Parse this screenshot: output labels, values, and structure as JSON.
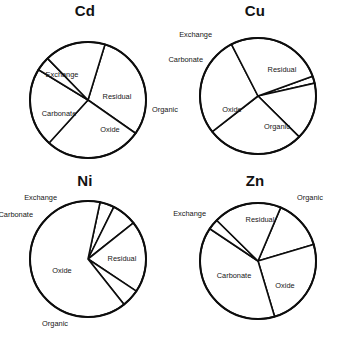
{
  "figure": {
    "background_color": "#ffffff",
    "stroke_color": "#0d0d0d",
    "slice_fill": "#ffffff"
  },
  "chart_data": [
    {
      "type": "pie",
      "title": "Cd",
      "categories": [
        "Exchange",
        "Carbonate",
        "Oxide",
        "Organic",
        "Residual"
      ],
      "values": [
        30,
        27,
        22,
        4,
        17
      ],
      "legend": "none",
      "labels_placement": [
        "inside",
        "inside",
        "inside",
        "outside-right",
        "inside"
      ],
      "start_angle_deg": 287,
      "direction": "clockwise"
    },
    {
      "type": "pie",
      "title": "Cu",
      "categories": [
        "Exchange",
        "Carbonate",
        "Oxide",
        "Organic",
        "Residual"
      ],
      "values": [
        2,
        16,
        27,
        28,
        27
      ],
      "legend": "none",
      "labels_placement": [
        "outside-top-left",
        "outside-left",
        "inside",
        "inside",
        "inside"
      ],
      "start_angle_deg": 340,
      "direction": "clockwise"
    },
    {
      "type": "pie",
      "title": "Ni",
      "categories": [
        "Exchange",
        "Carbonate",
        "Oxide",
        "Organic",
        "Residual"
      ],
      "values": [
        4,
        7,
        20,
        5,
        64
      ],
      "legend": "none",
      "labels_placement": [
        "outside-top",
        "outside-left",
        "inside",
        "outside-bottom",
        "inside"
      ],
      "start_angle_deg": 282,
      "direction": "clockwise"
    },
    {
      "type": "pie",
      "title": "Zn",
      "categories": [
        "Exchange",
        "Carbonate",
        "Oxide",
        "Organic",
        "Residual"
      ],
      "values": [
        14,
        25,
        39,
        3,
        19
      ],
      "legend": "none",
      "labels_placement": [
        "outside-left",
        "inside",
        "inside",
        "outside-top-right",
        "inside"
      ],
      "start_angle_deg": 293,
      "direction": "clockwise"
    }
  ],
  "panels": {
    "cd": {
      "title": "Cd",
      "slices": [
        {
          "name": "Exchange",
          "label": "Exchange",
          "value": 30,
          "label_x": 62,
          "label_y": 75,
          "placement": "inside"
        },
        {
          "name": "Carbonate",
          "label": "Carbonate",
          "value": 27,
          "label_x": 59,
          "label_y": 114,
          "placement": "inside"
        },
        {
          "name": "Oxide",
          "label": "Oxide",
          "value": 22,
          "label_x": 110,
          "label_y": 130,
          "placement": "inside"
        },
        {
          "name": "Organic",
          "label": "Organic",
          "value": 4,
          "label_x": 152,
          "label_y": 110,
          "placement": "outside"
        },
        {
          "name": "Residual",
          "label": "Residual",
          "value": 17,
          "label_x": 117,
          "label_y": 97,
          "placement": "inside"
        }
      ]
    },
    "cu": {
      "title": "Cu",
      "slices": [
        {
          "name": "Exchange",
          "label": "Exchange",
          "value": 2,
          "label_x": 42,
          "label_y": 35,
          "placement": "outside"
        },
        {
          "name": "Carbonate",
          "label": "Carbonate",
          "value": 16,
          "label_x": 33,
          "label_y": 60,
          "placement": "outside"
        },
        {
          "name": "Oxide",
          "label": "Oxide",
          "value": 27,
          "label_x": 62,
          "label_y": 110,
          "placement": "inside"
        },
        {
          "name": "Organic",
          "label": "Organic",
          "value": 28,
          "label_x": 107,
          "label_y": 127,
          "placement": "inside"
        },
        {
          "name": "Residual",
          "label": "Residual",
          "value": 27,
          "label_x": 112,
          "label_y": 70,
          "placement": "inside"
        }
      ]
    },
    "ni": {
      "title": "Ni",
      "slices": [
        {
          "name": "Exchange",
          "label": "Exchange",
          "value": 4,
          "label_x": 57,
          "label_y": 27,
          "placement": "outside"
        },
        {
          "name": "Carbonate",
          "label": "Carbonate",
          "value": 7,
          "label_x": 33,
          "label_y": 44,
          "placement": "outside"
        },
        {
          "name": "Oxide",
          "label": "Oxide",
          "value": 20,
          "label_x": 62,
          "label_y": 100,
          "placement": "inside"
        },
        {
          "name": "Organic",
          "label": "Organic",
          "value": 5,
          "label_x": 68,
          "label_y": 153,
          "placement": "outside"
        },
        {
          "name": "Residual",
          "label": "Residual",
          "value": 64,
          "label_x": 122,
          "label_y": 88,
          "placement": "inside"
        }
      ]
    },
    "zn": {
      "title": "Zn",
      "slices": [
        {
          "name": "Exchange",
          "label": "Exchange",
          "value": 14,
          "label_x": 36,
          "label_y": 43,
          "placement": "outside"
        },
        {
          "name": "Carbonate",
          "label": "Carbonate",
          "value": 25,
          "label_x": 64,
          "label_y": 105,
          "placement": "inside"
        },
        {
          "name": "Oxide",
          "label": "Oxide",
          "value": 39,
          "label_x": 115,
          "label_y": 115,
          "placement": "inside"
        },
        {
          "name": "Organic",
          "label": "Organic",
          "value": 3,
          "label_x": 127,
          "label_y": 27,
          "placement": "outside"
        },
        {
          "name": "Residual",
          "label": "Residual",
          "value": 19,
          "label_x": 90,
          "label_y": 49,
          "placement": "inside"
        }
      ]
    }
  }
}
